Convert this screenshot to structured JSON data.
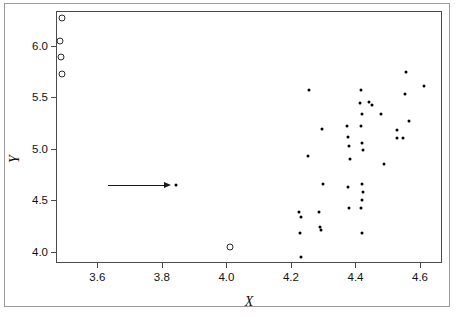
{
  "chart_data": {
    "type": "scatter",
    "title": "",
    "xlabel": "X",
    "ylabel": "Y",
    "xlim": [
      3.475,
      4.665
    ],
    "ylim": [
      3.9,
      6.33
    ],
    "grid": false,
    "legend": null,
    "xticks": [
      3.6,
      3.8,
      4.0,
      4.2,
      4.4,
      4.6
    ],
    "xticklabels": [
      "3.6",
      "3.8",
      "4.0",
      "4.2",
      "4.4",
      "4.6"
    ],
    "yticks": [
      4.0,
      4.5,
      5.0,
      5.5,
      6.0
    ],
    "yticklabels": [
      "4.0",
      "4.5",
      "5.0",
      "5.5",
      "6.0"
    ],
    "series": [
      {
        "name": "filled-points",
        "marker": "filled-circle",
        "color": "#000000",
        "points": [
          [
            3.845,
            4.645
          ],
          [
            4.225,
            4.385
          ],
          [
            4.23,
            4.34
          ],
          [
            4.228,
            4.178
          ],
          [
            4.232,
            3.945
          ],
          [
            4.255,
            5.57
          ],
          [
            4.252,
            4.93
          ],
          [
            4.288,
            4.385
          ],
          [
            4.29,
            4.24
          ],
          [
            4.292,
            4.215
          ],
          [
            4.295,
            5.19
          ],
          [
            4.298,
            4.66
          ],
          [
            4.375,
            5.225
          ],
          [
            4.378,
            5.115
          ],
          [
            4.38,
            5.025
          ],
          [
            4.382,
            4.905
          ],
          [
            4.378,
            4.625
          ],
          [
            4.38,
            4.425
          ],
          [
            4.418,
            5.57
          ],
          [
            4.415,
            5.45
          ],
          [
            4.42,
            5.34
          ],
          [
            4.418,
            5.22
          ],
          [
            4.42,
            5.06
          ],
          [
            4.422,
            4.985
          ],
          [
            4.42,
            4.66
          ],
          [
            4.422,
            4.58
          ],
          [
            4.42,
            4.505
          ],
          [
            4.418,
            4.425
          ],
          [
            4.42,
            4.178
          ],
          [
            4.442,
            5.46
          ],
          [
            4.452,
            5.425
          ],
          [
            4.478,
            5.34
          ],
          [
            4.488,
            4.85
          ],
          [
            4.528,
            5.18
          ],
          [
            4.53,
            5.105
          ],
          [
            4.548,
            5.108
          ],
          [
            4.552,
            5.535
          ],
          [
            4.556,
            5.742
          ],
          [
            4.565,
            5.27
          ],
          [
            4.612,
            5.615
          ]
        ]
      },
      {
        "name": "open-points",
        "marker": "open-circle",
        "color": "#2b2b2b",
        "points": [
          [
            3.49,
            6.27
          ],
          [
            3.485,
            6.045
          ],
          [
            3.488,
            5.895
          ],
          [
            3.49,
            5.725
          ],
          [
            4.01,
            4.045
          ]
        ]
      }
    ],
    "annotations": [
      {
        "name": "arrow-to-outlier",
        "type": "arrow",
        "from": [
          3.633,
          4.645
        ],
        "to": [
          3.825,
          4.645
        ],
        "label": ""
      }
    ]
  }
}
